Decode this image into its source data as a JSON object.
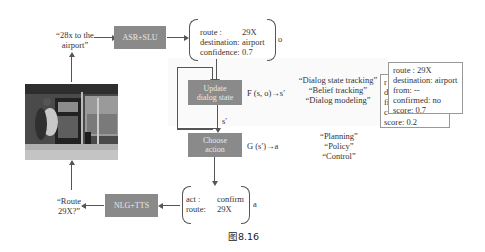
{
  "diagram": {
    "caption": "图8.16",
    "user_utterance": {
      "line1": "“28x to the",
      "line2": "airport”"
    },
    "system_utterance": {
      "line1": "“Route",
      "line2": "29X?”"
    },
    "boxes": {
      "asr_slu": "ASR+SLU",
      "update_state": {
        "line1": "Update",
        "line2": "dialog state"
      },
      "choose_action": {
        "line1": "Choose",
        "line2": "action"
      },
      "nlg_tts": "NLG+TTS"
    },
    "observation": {
      "label": "o",
      "fields": [
        {
          "key": "route :",
          "value": "29X"
        },
        {
          "key": "destination:",
          "value": "airport"
        },
        {
          "key": "confidence:",
          "value": "0.7"
        }
      ]
    },
    "state_function": "F (s, o)→s′",
    "state_label": "s′",
    "policy_function": "G (s′)→a",
    "state_aliases": [
      "“Dialog state tracking”",
      "“Belief tracking”",
      "“Dialog modeling”"
    ],
    "policy_aliases": [
      "“Planning”",
      "“Policy”",
      "“Control”"
    ],
    "belief_cards": {
      "front": [
        {
          "key": "route :",
          "value": "29X"
        },
        {
          "key": "destination:",
          "value": "airport"
        },
        {
          "key": "from:",
          "value": "--"
        },
        {
          "key": "confirmed:",
          "value": "no"
        },
        {
          "key": "score:",
          "value": "0.7"
        }
      ],
      "back_visible": [
        {
          "key": "r",
          "value": ""
        },
        {
          "key": "d",
          "value": ""
        },
        {
          "key": "fi",
          "value": ""
        },
        {
          "key": "c",
          "value": ""
        },
        {
          "key": "score:",
          "value": "0.2"
        }
      ]
    },
    "action": {
      "label": "a",
      "fields": [
        {
          "key": "act :",
          "value": "confirm"
        },
        {
          "key": "route:",
          "value": "29X"
        }
      ]
    },
    "colors": {
      "box_fill": "#8a8a8a",
      "box_text": "#e8e8e8",
      "line": "#555555"
    }
  }
}
